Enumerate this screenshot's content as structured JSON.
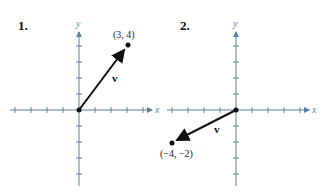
{
  "colors": {
    "axis": "#5a7fa3",
    "vector": "#111111",
    "background": "#ffffff"
  },
  "graphs": [
    {
      "number_label": "1.",
      "x_axis_label": "x",
      "y_axis_label": "y",
      "vector_label": "v",
      "point_label": "(3, 4)",
      "tail": [
        0,
        0
      ],
      "head": [
        3,
        4
      ]
    },
    {
      "number_label": "2.",
      "x_axis_label": "x",
      "y_axis_label": "y",
      "vector_label": "v",
      "point_label": "(−4, −2)",
      "tail": [
        0,
        0
      ],
      "head": [
        -4,
        -2
      ]
    }
  ]
}
